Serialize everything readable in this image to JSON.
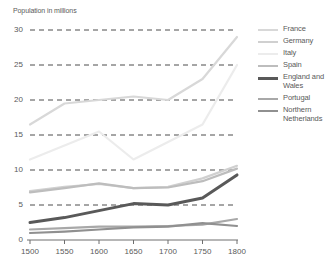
{
  "chart_data": {
    "type": "line",
    "title": "",
    "ylabel": "Population in millions",
    "xlabel": "",
    "x": [
      1500,
      1550,
      1600,
      1650,
      1700,
      1750,
      1800
    ],
    "xlim": [
      1500,
      1800
    ],
    "ylim": [
      0,
      30
    ],
    "yticks": [
      0,
      5,
      10,
      15,
      20,
      25,
      30
    ],
    "xticks": [
      "1500",
      "1550",
      "1600",
      "1650",
      "1700",
      "1750",
      "1800"
    ],
    "ytick_labels": [
      "0",
      "5",
      "10",
      "15",
      "20",
      "25",
      "30"
    ],
    "grid": "horizontal-dashed",
    "legend_position": "right",
    "series": [
      {
        "name": "France",
        "color": "#d8d8d8",
        "width": 2.2,
        "values": [
          16.5,
          19.5,
          20.0,
          20.5,
          20.0,
          23.0,
          29.0
        ]
      },
      {
        "name": "Germany",
        "color": "#d0d0d0",
        "width": 2.2,
        "values": [
          7.0,
          7.6,
          8.0,
          7.4,
          7.6,
          8.8,
          10.6
        ]
      },
      {
        "name": "Italy",
        "color": "#ececec",
        "width": 2.2,
        "values": [
          11.5,
          13.5,
          15.5,
          11.5,
          14.0,
          16.5,
          25.0
        ]
      },
      {
        "name": "Spain",
        "color": "#bdbdbd",
        "width": 2.2,
        "values": [
          6.8,
          7.4,
          8.1,
          7.4,
          7.5,
          8.4,
          10.2
        ]
      },
      {
        "name": "England and Wales",
        "color": "#595959",
        "width": 3.0,
        "values": [
          2.5,
          3.2,
          4.2,
          5.2,
          5.0,
          6.0,
          9.3
        ]
      },
      {
        "name": "Portugal",
        "color": "#a8a8a8",
        "width": 2.2,
        "values": [
          1.5,
          1.7,
          1.9,
          1.9,
          2.0,
          2.2,
          3.0
        ]
      },
      {
        "name": "Northern Netherlands",
        "color": "#909090",
        "width": 2.2,
        "values": [
          1.0,
          1.2,
          1.5,
          1.8,
          1.9,
          2.4,
          2.0
        ]
      }
    ]
  },
  "legend": {
    "items": [
      {
        "label": "France"
      },
      {
        "label": "Germany"
      },
      {
        "label": "Italy"
      },
      {
        "label": "Spain"
      },
      {
        "label": "England and Wales"
      },
      {
        "label": "Portugal"
      },
      {
        "label": "Northern Netherlands"
      }
    ]
  }
}
